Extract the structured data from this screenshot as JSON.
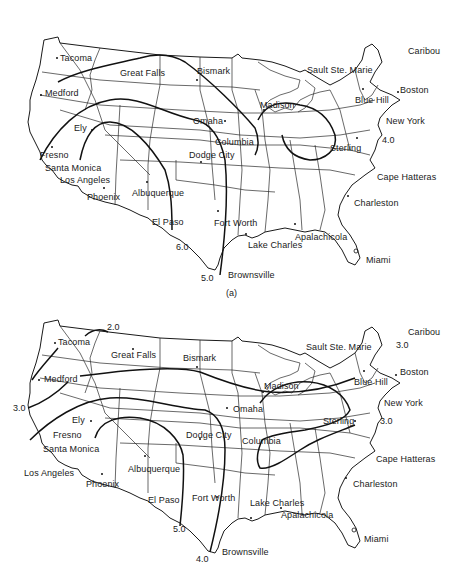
{
  "figure": {
    "maps": [
      {
        "id": "a",
        "caption": "(a)",
        "cities": [
          {
            "name": "Tacoma",
            "x": 58,
            "y": 54
          },
          {
            "name": "Great Falls",
            "x": 120,
            "y": 67
          },
          {
            "name": "Bismark",
            "x": 197,
            "y": 64
          },
          {
            "name": "Medford",
            "x": 45,
            "y": 88
          },
          {
            "name": "Omaha",
            "x": 193,
            "y": 116
          },
          {
            "name": "Columbia",
            "x": 215,
            "y": 137
          },
          {
            "name": "Ely",
            "x": 74,
            "y": 123
          },
          {
            "name": "Fresno",
            "x": 40,
            "y": 155
          },
          {
            "name": "Santa Monica",
            "x": 43,
            "y": 165
          },
          {
            "name": "Los Angeles",
            "x": 58,
            "y": 177
          },
          {
            "name": "Phoenix",
            "x": 88,
            "y": 190
          },
          {
            "name": "Albuquerque",
            "x": 132,
            "y": 186
          },
          {
            "name": "El Paso",
            "x": 152,
            "y": 217
          },
          {
            "name": "Dodge City",
            "x": 189,
            "y": 150
          },
          {
            "name": "Fort Worth",
            "x": 214,
            "y": 218
          },
          {
            "name": "Brownsville",
            "x": 228,
            "y": 271
          },
          {
            "name": "Madison",
            "x": 260,
            "y": 100
          },
          {
            "name": "Sault Ste. Marie",
            "x": 307,
            "y": 65
          },
          {
            "name": "Caribou",
            "x": 408,
            "y": 48
          },
          {
            "name": "Boston",
            "x": 400,
            "y": 87
          },
          {
            "name": "Blue Hill",
            "x": 354,
            "y": 96
          },
          {
            "name": "New York",
            "x": 386,
            "y": 117
          },
          {
            "name": "Sterling",
            "x": 330,
            "y": 142
          },
          {
            "name": "Cape Hatteras",
            "x": 377,
            "y": 174
          },
          {
            "name": "Charleston",
            "x": 354,
            "y": 200
          },
          {
            "name": "Lake Charles",
            "x": 248,
            "y": 241
          },
          {
            "name": "Apalachicola",
            "x": 295,
            "y": 233
          },
          {
            "name": "Miami",
            "x": 366,
            "y": 256
          }
        ],
        "contour_labels": [
          {
            "value": "4.0",
            "x": 382,
            "y": 135
          },
          {
            "value": "6.0",
            "x": 176,
            "y": 242
          },
          {
            "value": "5.0",
            "x": 201,
            "y": 273
          }
        ]
      },
      {
        "id": "b",
        "caption": "",
        "cities": [
          {
            "name": "Tacoma",
            "x": 58,
            "y": 49
          },
          {
            "name": "Great Falls",
            "x": 111,
            "y": 60
          },
          {
            "name": "Bismark",
            "x": 183,
            "y": 63
          },
          {
            "name": "Medford",
            "x": 44,
            "y": 84
          },
          {
            "name": "Omaha",
            "x": 233,
            "y": 114
          },
          {
            "name": "Ely",
            "x": 72,
            "y": 125
          },
          {
            "name": "Fresno",
            "x": 53,
            "y": 140
          },
          {
            "name": "Santa Monica",
            "x": 43,
            "y": 154
          },
          {
            "name": "Los Angeles",
            "x": 24,
            "y": 180
          },
          {
            "name": "Phoenix",
            "x": 86,
            "y": 191
          },
          {
            "name": "Albuquerque",
            "x": 128,
            "y": 175
          },
          {
            "name": "El Paso",
            "x": 148,
            "y": 207
          },
          {
            "name": "Dodge City",
            "x": 186,
            "y": 141
          },
          {
            "name": "Columbia",
            "x": 242,
            "y": 149
          },
          {
            "name": "Fort Worth",
            "x": 192,
            "y": 203
          },
          {
            "name": "Brownsville",
            "x": 224,
            "y": 257
          },
          {
            "name": "Madison",
            "x": 264,
            "y": 93
          },
          {
            "name": "Sault Ste. Marie",
            "x": 306,
            "y": 51
          },
          {
            "name": "Caribou",
            "x": 408,
            "y": 39
          },
          {
            "name": "Boston",
            "x": 400,
            "y": 78
          },
          {
            "name": "Blue Hill",
            "x": 354,
            "y": 89
          },
          {
            "name": "New York",
            "x": 384,
            "y": 110
          },
          {
            "name": "Sterling",
            "x": 323,
            "y": 128
          },
          {
            "name": "Cape Hatteras",
            "x": 376,
            "y": 166
          },
          {
            "name": "Charleston",
            "x": 353,
            "y": 191
          },
          {
            "name": "Lake Charles",
            "x": 250,
            "y": 210
          },
          {
            "name": "Apalachicola",
            "x": 281,
            "y": 222
          },
          {
            "name": "Miami",
            "x": 364,
            "y": 245
          }
        ],
        "contour_labels": [
          {
            "value": "2.0",
            "x": 107,
            "y": 35
          },
          {
            "value": "3.0",
            "x": 396,
            "y": 52
          },
          {
            "value": "3.0",
            "x": 13,
            "y": 115
          },
          {
            "value": "3.0",
            "x": 380,
            "y": 128
          },
          {
            "value": "5.0",
            "x": 173,
            "y": 236
          },
          {
            "value": "4.0",
            "x": 196,
            "y": 262
          }
        ]
      }
    ]
  }
}
